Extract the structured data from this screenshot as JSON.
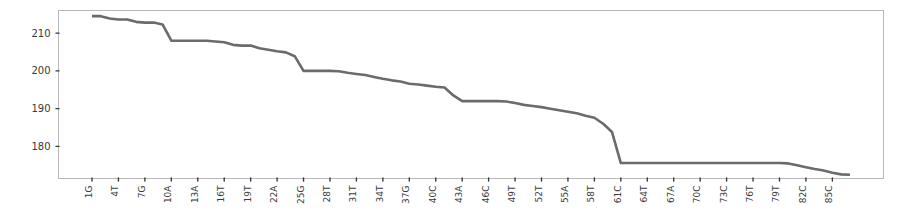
{
  "figure": {
    "background_color": "#ffffff",
    "axes_color": "#b8b8b8",
    "tick_color": "#3a3a3a"
  },
  "chart_data": {
    "type": "line",
    "title": "",
    "xlabel": "",
    "ylabel": "",
    "grid": false,
    "legend": false,
    "line_color": "#6b6b6b",
    "ylim": [
      171.5,
      216.0
    ],
    "yticks": [
      180,
      190,
      200,
      210
    ],
    "ytick_labels": [
      "180",
      "190",
      "200",
      "210"
    ],
    "xtick_labels": [
      "1G",
      "4T",
      "7G",
      "10A",
      "13A",
      "16T",
      "19T",
      "22A",
      "25G",
      "28T",
      "31T",
      "34T",
      "37G",
      "40C",
      "43A",
      "46C",
      "49T",
      "52T",
      "55A",
      "58T",
      "61C",
      "64T",
      "67A",
      "70C",
      "73C",
      "76T",
      "79T",
      "82C",
      "85C"
    ],
    "x": [
      1,
      2,
      3,
      4,
      5,
      6,
      7,
      8,
      9,
      10,
      11,
      12,
      13,
      14,
      15,
      16,
      17,
      18,
      19,
      20,
      21,
      22,
      23,
      24,
      25,
      26,
      27,
      28,
      29,
      30,
      31,
      32,
      33,
      34,
      35,
      36,
      37,
      38,
      39,
      40,
      41,
      42,
      43,
      44,
      45,
      46,
      47,
      48,
      49,
      50,
      51,
      52,
      53,
      54,
      55,
      56,
      57,
      58,
      59,
      60,
      61,
      62,
      63,
      64,
      65,
      66,
      67,
      68,
      69,
      70,
      71,
      72,
      73,
      74,
      75,
      76,
      77,
      78,
      79,
      80,
      81,
      82,
      83,
      84,
      85,
      86,
      87
    ],
    "values": [
      214.5,
      214.5,
      213.9,
      213.6,
      213.6,
      213.0,
      212.8,
      212.8,
      212.3,
      208.0,
      208.0,
      208.0,
      208.0,
      208.0,
      207.8,
      207.6,
      206.9,
      206.7,
      206.7,
      206.0,
      205.6,
      205.2,
      204.9,
      203.9,
      200.0,
      200.0,
      200.0,
      200.0,
      199.9,
      199.5,
      199.2,
      198.9,
      198.4,
      197.9,
      197.5,
      197.2,
      196.6,
      196.4,
      196.1,
      195.8,
      195.6,
      193.5,
      192.0,
      192.0,
      192.0,
      192.0,
      192.0,
      191.9,
      191.5,
      191.0,
      190.7,
      190.4,
      190.0,
      189.6,
      189.2,
      188.8,
      188.1,
      187.6,
      186.0,
      183.8,
      175.6,
      175.6,
      175.6,
      175.6,
      175.6,
      175.6,
      175.6,
      175.6,
      175.6,
      175.6,
      175.6,
      175.6,
      175.6,
      175.6,
      175.6,
      175.6,
      175.6,
      175.6,
      175.6,
      175.5,
      175.0,
      174.5,
      174.0,
      173.6,
      173.0,
      172.6,
      172.5
    ]
  }
}
